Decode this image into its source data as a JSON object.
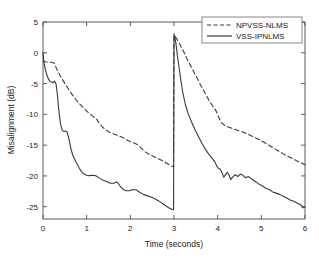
{
  "chart_data": {
    "type": "line",
    "title": "",
    "xlabel": "Time (seconds)",
    "ylabel": "Misalignment (dB)",
    "xlim": [
      0,
      6
    ],
    "ylim": [
      -27,
      5
    ],
    "xticks": [
      0,
      1,
      2,
      3,
      4,
      5,
      6
    ],
    "xticklabels": [
      "0",
      "1",
      "2",
      "3",
      "4",
      "5",
      "6"
    ],
    "yticks": [
      5,
      0,
      -5,
      -10,
      -15,
      -20,
      -25
    ],
    "yticklabels": [
      "5",
      "0",
      "-5",
      "-10",
      "-15",
      "-20",
      "-25"
    ],
    "grid": false,
    "legend_position": "top-right",
    "annotations": [
      "Echo path change at t = 3 s causes both curves to jump to about +3 dB"
    ],
    "series": [
      {
        "name": "NPVSS-NLMS",
        "style": "dashed",
        "color": "#3a3a3a",
        "x": [
          0.0,
          0.05,
          0.12,
          0.2,
          0.26,
          0.3,
          0.36,
          0.44,
          0.52,
          0.6,
          0.7,
          0.8,
          0.92,
          1.02,
          1.14,
          1.24,
          1.3,
          1.4,
          1.52,
          1.62,
          1.74,
          1.86,
          1.96,
          2.06,
          2.16,
          2.24,
          2.34,
          2.46,
          2.58,
          2.7,
          2.82,
          2.92,
          2.99,
          3.0,
          3.06,
          3.14,
          3.22,
          3.3,
          3.4,
          3.5,
          3.6,
          3.7,
          3.8,
          3.88,
          3.96,
          4.02,
          4.08,
          4.16,
          4.26,
          4.38,
          4.5,
          4.62,
          4.74,
          4.86,
          4.98,
          5.1,
          5.24,
          5.38,
          5.52,
          5.66,
          5.8,
          5.92,
          6.0
        ],
        "y": [
          -1.3,
          -1.45,
          -1.5,
          -1.55,
          -1.7,
          -2.4,
          -3.3,
          -4.3,
          -5.2,
          -6.1,
          -7.1,
          -8.0,
          -8.9,
          -9.6,
          -10.3,
          -10.9,
          -11.6,
          -12.3,
          -12.9,
          -13.2,
          -13.5,
          -13.9,
          -14.3,
          -14.6,
          -14.9,
          -15.4,
          -16.1,
          -16.6,
          -17.0,
          -17.4,
          -17.9,
          -18.3,
          -18.5,
          2.8,
          2.3,
          1.3,
          0.2,
          -1.0,
          -2.4,
          -3.7,
          -5.1,
          -6.4,
          -7.7,
          -8.6,
          -9.4,
          -10.4,
          -11.3,
          -11.8,
          -12.1,
          -12.4,
          -12.7,
          -13.0,
          -13.4,
          -13.8,
          -14.2,
          -14.7,
          -15.3,
          -15.9,
          -16.5,
          -17.0,
          -17.5,
          -17.9,
          -18.2
        ]
      },
      {
        "name": "VSS-IPNLMS",
        "style": "solid",
        "color": "#3a3a3a",
        "x": [
          0.0,
          0.02,
          0.05,
          0.08,
          0.12,
          0.16,
          0.2,
          0.24,
          0.26,
          0.28,
          0.3,
          0.33,
          0.36,
          0.4,
          0.44,
          0.48,
          0.52,
          0.56,
          0.6,
          0.64,
          0.68,
          0.72,
          0.76,
          0.82,
          0.88,
          0.94,
          1.0,
          1.06,
          1.14,
          1.22,
          1.3,
          1.38,
          1.46,
          1.54,
          1.62,
          1.68,
          1.72,
          1.78,
          1.84,
          1.9,
          1.98,
          2.06,
          2.14,
          2.22,
          2.3,
          2.38,
          2.46,
          2.56,
          2.66,
          2.76,
          2.86,
          2.94,
          2.99,
          3.0,
          3.02,
          3.05,
          3.08,
          3.12,
          3.16,
          3.2,
          3.26,
          3.32,
          3.4,
          3.48,
          3.56,
          3.64,
          3.72,
          3.8,
          3.88,
          3.94,
          3.98,
          4.02,
          4.06,
          4.1,
          4.14,
          4.18,
          4.22,
          4.26,
          4.3,
          4.34,
          4.4,
          4.46,
          4.52,
          4.58,
          4.64,
          4.7,
          4.78,
          4.86,
          4.94,
          5.02,
          5.1,
          5.18,
          5.26,
          5.34,
          5.42,
          5.5,
          5.58,
          5.66,
          5.74,
          5.82,
          5.9,
          5.96,
          6.0
        ],
        "y": [
          0.0,
          -1.4,
          -2.6,
          -3.4,
          -4.2,
          -4.6,
          -4.8,
          -4.85,
          -4.6,
          -4.75,
          -5.1,
          -6.8,
          -9.2,
          -11.5,
          -12.6,
          -12.8,
          -12.7,
          -13.0,
          -14.2,
          -15.6,
          -16.6,
          -17.2,
          -17.8,
          -18.6,
          -19.3,
          -19.7,
          -19.9,
          -19.95,
          -19.9,
          -20.0,
          -20.4,
          -20.7,
          -20.9,
          -21.2,
          -21.2,
          -21.0,
          -21.2,
          -21.8,
          -22.2,
          -22.4,
          -22.4,
          -22.2,
          -22.3,
          -22.7,
          -23.0,
          -23.2,
          -23.4,
          -23.7,
          -24.1,
          -24.6,
          -25.1,
          -25.4,
          -25.5,
          3.1,
          2.6,
          1.2,
          -0.6,
          -2.6,
          -4.6,
          -6.4,
          -8.4,
          -9.8,
          -11.2,
          -12.5,
          -13.6,
          -14.7,
          -15.7,
          -16.5,
          -17.2,
          -17.8,
          -18.4,
          -18.8,
          -18.9,
          -19.5,
          -20.2,
          -19.8,
          -19.4,
          -19.9,
          -20.6,
          -20.2,
          -19.8,
          -20.1,
          -19.7,
          -19.9,
          -20.3,
          -20.1,
          -20.5,
          -20.9,
          -21.3,
          -21.6,
          -22.0,
          -22.2,
          -22.6,
          -22.8,
          -23.0,
          -23.3,
          -23.6,
          -23.9,
          -24.1,
          -24.4,
          -24.7,
          -25.2,
          -25.0
        ]
      }
    ]
  },
  "legend": {
    "entries": [
      {
        "label": "NPVSS-NLMS",
        "style": "dashed"
      },
      {
        "label": "VSS-IPNLMS",
        "style": "solid"
      }
    ]
  }
}
